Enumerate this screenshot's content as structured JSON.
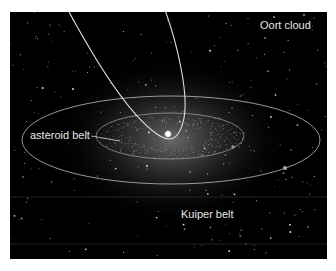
{
  "figure": {
    "background_color": "#000000",
    "page_color": "#ffffff",
    "line_color": "#d8d8d8",
    "star_color": "#ffffff",
    "panel": {
      "x": 10,
      "y": 12,
      "width": 317,
      "height": 247
    }
  },
  "labels": {
    "oort_cloud": "Oort cloud",
    "asteroid_belt": "asteroid belt",
    "kuiper_belt": "Kuiper belt"
  },
  "elements": {
    "sun": {
      "name": "sun",
      "cx": 168,
      "cy": 134
    },
    "inner_orbit": {
      "name": "asteroid-belt-orbit",
      "cx": 170,
      "cy": 136,
      "rx": 74,
      "ry": 23
    },
    "outer_orbit": {
      "name": "outer-planet-orbit",
      "cx": 171,
      "cy": 140,
      "rx": 149,
      "ry": 44
    },
    "inner_planet": {
      "cx": 233,
      "cy": 147
    },
    "outer_planet": {
      "cx": 285,
      "cy": 168
    },
    "comet_orbit": {
      "name": "comet-orbit"
    },
    "kuiper_band": {
      "top_y": 197,
      "bottom_y": 244
    }
  }
}
